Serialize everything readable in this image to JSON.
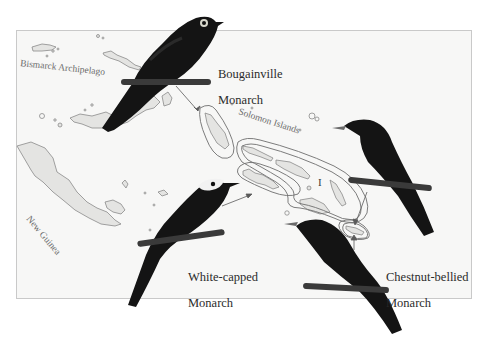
{
  "figure": {
    "map": {
      "region_labels": {
        "bismarck": "Bismarck Archipelago",
        "solomon": "Solomon Islands",
        "new_guinea": "New Guinea"
      },
      "range_marker": "I",
      "colors": {
        "background": "#f7f7f6",
        "frame": "#c9c9c9",
        "land_fill": "#e4e4e2",
        "land_stroke": "#8a8a8a",
        "range_outline": "#6e6e6e",
        "arrow": "#5a5a5a"
      }
    },
    "species": [
      {
        "name": "Bougainville Monarch",
        "line1": "Bougainville",
        "line2": "Monarch",
        "plumage": "all black with pale eye ring"
      },
      {
        "name": "White-capped Monarch",
        "line1": "White-capped",
        "line2": "Monarch",
        "plumage": "black with white cap"
      },
      {
        "name": "Chestnut-bellied Monarch",
        "line1": "Chestnut-bellied",
        "line2": "Monarch",
        "plumage": "dark, perched right"
      },
      {
        "name": "Chestnut-bellied Monarch (second form)",
        "line1": "",
        "line2": "",
        "plumage": "dark, perched lower center"
      }
    ],
    "colors": {
      "bird_body": "#141414",
      "bird_sheen": "#2a2a2a",
      "perch": "#3a3a3a",
      "white_cap": "#f2f2f2",
      "label_text": "#2b2b2b"
    }
  }
}
